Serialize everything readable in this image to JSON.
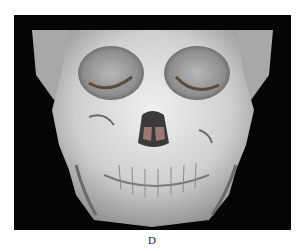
{
  "figure": {
    "panel_label": "D",
    "background_color": "#050505",
    "bone_color": "#d9d9d9"
  }
}
